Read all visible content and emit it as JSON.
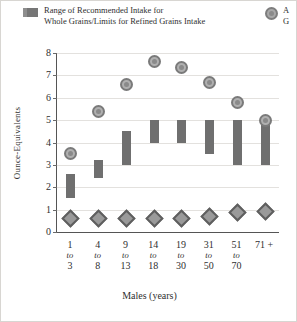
{
  "legend": {
    "range": {
      "label": "Range of Recommended Intake for\nWhole Grains/Limits for Refined Grains Intake",
      "swatch": "range-swatch"
    },
    "average": {
      "label": "A\nG",
      "swatch": "circle-swatch"
    }
  },
  "axes": {
    "y_title": "Ounce-Equivalents",
    "x_title": "Males (years)",
    "y_ticks": [
      "0",
      "1",
      "2",
      "3",
      "4",
      "5",
      "6",
      "7",
      "8"
    ]
  },
  "colors": {
    "bar": "#6f6f6f",
    "average_marker": "#b0b0b0",
    "whole_grain_marker": "#9a9a9a",
    "gridline": "#e3e1de",
    "axis": "#555555",
    "text": "#2f2f2f",
    "figure_border": "#d8d6d2"
  },
  "x_labels": [
    {
      "top": "1",
      "mid": "to",
      "bottom": "3"
    },
    {
      "top": "4",
      "mid": "to",
      "bottom": "8"
    },
    {
      "top": "9",
      "mid": "to",
      "bottom": "13"
    },
    {
      "top": "14",
      "mid": "to",
      "bottom": "18"
    },
    {
      "top": "19",
      "mid": "to",
      "bottom": "30"
    },
    {
      "top": "31",
      "mid": "to",
      "bottom": "50"
    },
    {
      "top": "51",
      "mid": "to",
      "bottom": "70"
    },
    {
      "top": "71 +",
      "mid": "",
      "bottom": ""
    }
  ],
  "chart_data": {
    "type": "bar",
    "title": "",
    "subtitle": "",
    "xlabel": "Males (years)",
    "ylabel": "Ounce-Equivalents",
    "ylim": [
      0,
      8
    ],
    "ytick_values": [
      0,
      1,
      2,
      3,
      4,
      5,
      6,
      7,
      8
    ],
    "grid": true,
    "legend_position": "top",
    "categories": [
      "1 to 3",
      "4 to 8",
      "9 to 13",
      "14 to 18",
      "19 to 30",
      "31 to 50",
      "51 to 70",
      "71 +"
    ],
    "series": [
      {
        "name": "Range of Recommended Intake for Whole Grains/Limits for Refined Grains Intake",
        "type": "range-bar",
        "low": [
          1.5,
          2.4,
          3.0,
          4.0,
          4.0,
          3.5,
          3.0,
          3.0
        ],
        "high": [
          2.6,
          3.2,
          4.5,
          5.0,
          5.0,
          5.0,
          5.0,
          5.0
        ]
      },
      {
        "name": "Average Intake",
        "type": "marker-circle",
        "values": [
          3.5,
          5.4,
          6.6,
          7.6,
          7.35,
          6.7,
          5.8,
          5.0
        ]
      },
      {
        "name": "Whole Grains Intake",
        "type": "marker-diamond",
        "values": [
          0.6,
          0.6,
          0.6,
          0.6,
          0.6,
          0.7,
          0.85,
          0.9
        ]
      }
    ]
  }
}
